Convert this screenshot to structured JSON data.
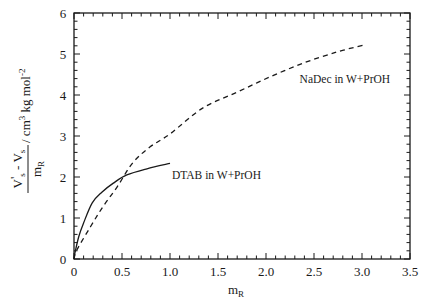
{
  "chart_data": {
    "type": "line",
    "title": "",
    "xlabel": "m_R",
    "ylabel": "(V's - Vs) / m_R / cm3 kg mol-2",
    "xlim": [
      0,
      3.5
    ],
    "ylim": [
      0,
      6
    ],
    "grid": false,
    "legend_position": "inline annotations",
    "x_ticks": [
      "0",
      "0.5",
      "1.0",
      "1.5",
      "2.0",
      "2.5",
      "3.0",
      "3.5"
    ],
    "y_ticks": [
      "0",
      "1",
      "2",
      "3",
      "4",
      "5",
      "6"
    ],
    "series": [
      {
        "name": "DTAB in W+PrOH",
        "style": "solid",
        "x": [
          0.0,
          0.01,
          0.05,
          0.1,
          0.19,
          0.29,
          0.41,
          0.55,
          0.76,
          1.0
        ],
        "y": [
          0.0,
          0.15,
          0.55,
          0.88,
          1.37,
          1.63,
          1.85,
          2.05,
          2.2,
          2.33
        ]
      },
      {
        "name": "NaDec in W+PrOH",
        "style": "dashed",
        "x": [
          0.0,
          0.03,
          0.17,
          0.3,
          0.45,
          0.61,
          0.79,
          1.0,
          1.34,
          1.7,
          2.04,
          2.39,
          2.74,
          3.02
        ],
        "y": [
          0.0,
          0.22,
          0.78,
          1.27,
          1.76,
          2.34,
          2.73,
          3.05,
          3.68,
          4.07,
          4.44,
          4.78,
          5.05,
          5.22
        ]
      }
    ],
    "annotations": [
      {
        "text": "DTAB in W+PrOH",
        "x": 1.02,
        "y": 1.95
      },
      {
        "text": "NaDec in W+PrOH",
        "x": 2.35,
        "y": 4.3
      }
    ]
  },
  "axes": {
    "x_label_main": "m",
    "x_label_sub": "R",
    "y_label": {
      "num_main1": "V",
      "num_prime": "'",
      "num_sub1": "s",
      "num_minus": " - V",
      "num_sub2": "s",
      "den_main": "m",
      "den_sub": "R",
      "units_pre": "/ cm",
      "units_sup1": "3",
      "units_mid": " kg mol",
      "units_sup2": "-2"
    }
  }
}
